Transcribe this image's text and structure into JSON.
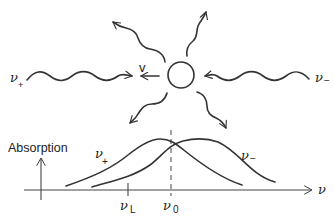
{
  "diagram": {
    "atom": {
      "shape": "circle",
      "velocity_label": "v"
    },
    "beams": [
      {
        "name": "left-beam",
        "label": "ν",
        "subscript": "+",
        "direction": "toward atom from left"
      },
      {
        "name": "right-beam",
        "label": "ν",
        "subscript": "−",
        "direction": "toward atom from right"
      }
    ],
    "scattered_photons": 4,
    "plot": {
      "ylabel": "Absorption",
      "xlabel": "ν",
      "ticks": [
        {
          "label": "ν",
          "subscript": "L"
        },
        {
          "label": "ν",
          "subscript": "0"
        }
      ],
      "curves": [
        {
          "label": "ν",
          "subscript": "+",
          "description": "absorption profile shifted toward lower frequency"
        },
        {
          "label": "ν",
          "subscript": "−",
          "description": "absorption profile shifted toward higher frequency"
        }
      ]
    },
    "colors": {
      "ink": "#333333",
      "background": "#ffffff"
    }
  }
}
